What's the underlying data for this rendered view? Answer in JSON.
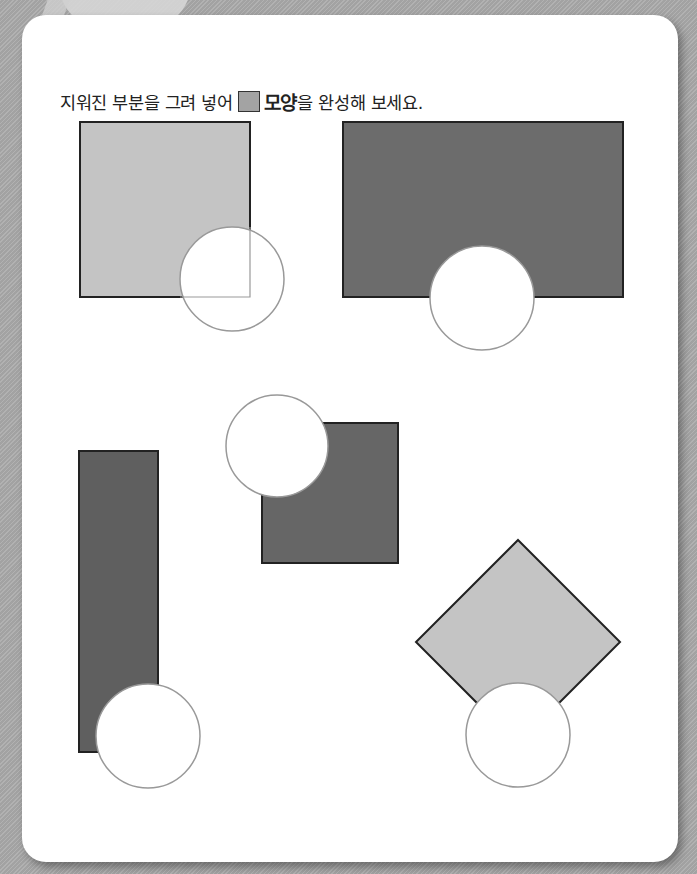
{
  "instruction": {
    "prefix": "지워진 부분을 그려 넣어",
    "shape_word": "모양",
    "suffix": "을 완성해 보세요.",
    "swatch_color": "#a3a3a3"
  },
  "colors": {
    "background": "#a9a9a9",
    "card": "#ffffff",
    "light_fill": "#c4c4c4",
    "dark_fill": "#6c6c6c",
    "outline": "#222222",
    "circle_outline": "#999999"
  },
  "shapes": [
    {
      "name": "light-square",
      "type": "rect",
      "fill": "light",
      "x": 80,
      "y": 122,
      "w": 170,
      "h": 175,
      "eraser": {
        "cx": 232,
        "cy": 279,
        "r": 52
      }
    },
    {
      "name": "dark-wide-rectangle",
      "type": "rect",
      "fill": "dark",
      "x": 343,
      "y": 122,
      "w": 280,
      "h": 175,
      "eraser": {
        "cx": 482,
        "cy": 298,
        "r": 52
      }
    },
    {
      "name": "dark-square",
      "type": "rect",
      "fill": "dark",
      "x": 262,
      "y": 423,
      "w": 136,
      "h": 140,
      "eraser": {
        "cx": 277,
        "cy": 446,
        "r": 51
      }
    },
    {
      "name": "dark-tall-rectangle",
      "type": "rect",
      "fill": "dark",
      "x": 79,
      "y": 451,
      "w": 79,
      "h": 301,
      "eraser": {
        "cx": 148,
        "cy": 736,
        "r": 52
      }
    },
    {
      "name": "light-diamond",
      "type": "diamond",
      "fill": "light",
      "cx": 518,
      "cy": 642,
      "half": 102,
      "eraser": {
        "cx": 518,
        "cy": 735,
        "r": 52
      }
    }
  ]
}
